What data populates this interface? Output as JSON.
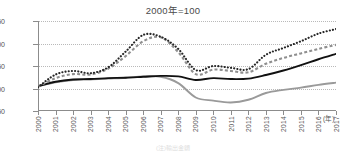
{
  "chart_data": {
    "type": "line",
    "title": "2000年=100",
    "xlabel": "(年)",
    "ylabel": "",
    "xlim": [
      2000,
      2017
    ],
    "ylim": [
      50,
      250
    ],
    "grid": true,
    "legend_position": "none",
    "x": [
      2000,
      2001,
      2002,
      2003,
      2004,
      2005,
      2006,
      2007,
      2008,
      2009,
      2010,
      2011,
      2012,
      2013,
      2014,
      2015,
      2016,
      2017
    ],
    "ytick_labels": [
      "250",
      "200",
      "150",
      "100",
      "50"
    ],
    "ytick_values": [
      250,
      200,
      150,
      100,
      50
    ],
    "xtick_labels": [
      "2000",
      "2001",
      "2002",
      "2003",
      "2004",
      "2005",
      "2006",
      "2007",
      "2008",
      "2009",
      "2010",
      "2011",
      "2012",
      "2013",
      "2014",
      "2015",
      "2016",
      "2017"
    ],
    "series": [
      {
        "name": "series-black-dotted",
        "style": "dotted",
        "color": "#262626",
        "values": [
          103,
          131,
          139,
          134,
          147,
          182,
          219,
          215,
          188,
          141,
          150,
          146,
          143,
          175,
          190,
          205,
          222,
          232
        ]
      },
      {
        "name": "series-gray-dashed",
        "style": "dashed",
        "color": "#8f8f8f",
        "values": [
          104,
          123,
          132,
          131,
          144,
          172,
          205,
          214,
          181,
          132,
          142,
          139,
          136,
          155,
          168,
          178,
          188,
          197
        ]
      },
      {
        "name": "series-black-solid",
        "style": "solid",
        "color": "#111111",
        "values": [
          105,
          115,
          120,
          121,
          123,
          124,
          126,
          128,
          127,
          119,
          123,
          121,
          122,
          130,
          140,
          152,
          165,
          177
        ]
      },
      {
        "name": "series-gray-solid",
        "style": "solid",
        "color": "#9a9a9a",
        "values": [
          105,
          114,
          119,
          120,
          122,
          124,
          127,
          126,
          112,
          80,
          73,
          69,
          75,
          90,
          97,
          102,
          108,
          113
        ]
      }
    ]
  },
  "notes": {
    "source_text": "(注)輸出金額"
  }
}
